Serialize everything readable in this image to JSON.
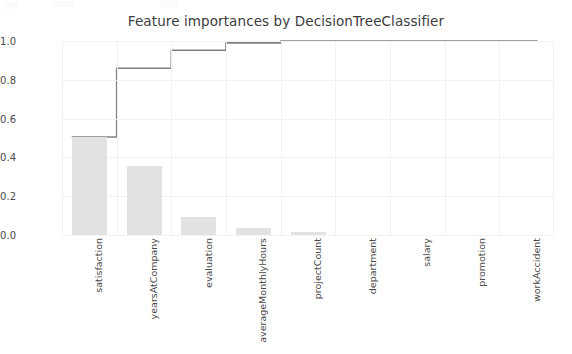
{
  "chart_data": {
    "type": "bar",
    "title": "Feature importances by DecisionTreeClassifier",
    "xlabel": "",
    "ylabel": "",
    "ylim": [
      0.0,
      1.05
    ],
    "yticks": [
      "0.0",
      "0.2",
      "0.4",
      "0.6",
      "0.8",
      "1.0"
    ],
    "ytick_values": [
      0.0,
      0.2,
      0.4,
      0.6,
      0.8,
      1.0
    ],
    "grid": true,
    "legend": "none",
    "categories": [
      "satisfaction",
      "yearsAtCompany",
      "evaluation",
      "averageMonthlyHours",
      "projectCount",
      "department",
      "salary",
      "promotion",
      "workAccident"
    ],
    "series": [
      {
        "name": "importance",
        "type": "bar",
        "values": [
          0.505,
          0.355,
          0.092,
          0.038,
          0.013,
          0.0,
          0.0,
          0.0,
          0.0
        ]
      },
      {
        "name": "cumulative importance",
        "type": "step",
        "values": [
          0.505,
          0.86,
          0.952,
          0.99,
          1.0,
          1.0,
          1.0,
          1.0,
          1.0
        ]
      }
    ]
  },
  "style": {
    "bar_color": "#e2e2e2",
    "line_color": "#808080",
    "grid_color": "#f2f2f2",
    "text_color": "#4a4a4a",
    "title_color": "#3c3c3c",
    "background": "#ffffff"
  }
}
